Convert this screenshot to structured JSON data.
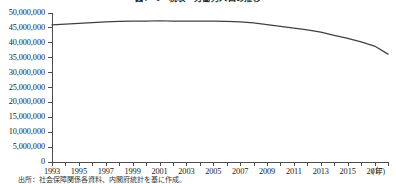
{
  "figure": {
    "title": "図4－1　税収・労働力人口の推移",
    "source_note": "出所：社会保障関係各資料、内閣府統計を基に作成。"
  },
  "axes": {
    "y": {
      "label": "",
      "min": 0,
      "max": 50000000,
      "step": 5000000,
      "tick_labels": [
        "50,000,000",
        "45,000,000",
        "40,000,000",
        "35,000,000",
        "30,000,000",
        "25,000,000",
        "20,000,000",
        "15,000,000",
        "10,000,000",
        "5,000,000",
        "0"
      ]
    },
    "x": {
      "unit_label": "(年)",
      "min": 1993,
      "max": 2018,
      "tick_labels": [
        "1993",
        "1995",
        "1997",
        "1999",
        "2001",
        "2003",
        "2005",
        "2007",
        "2009",
        "2011",
        "2013",
        "2015",
        "2017"
      ]
    }
  },
  "style": {
    "line_color": "#404040",
    "axis_color": "#4d4d4d",
    "text_color": "#1a1a1a",
    "background": "#ffffff"
  },
  "chart_data": {
    "type": "line",
    "title": "図4－1　税収・労働力人口の推移",
    "xlabel": "(年)",
    "ylabel": "",
    "xlim": [
      1993,
      2018
    ],
    "ylim": [
      0,
      50000000
    ],
    "grid": false,
    "legend": "none",
    "x": [
      1993,
      1994,
      1995,
      1996,
      1997,
      1998,
      1999,
      2000,
      2001,
      2002,
      2003,
      2004,
      2005,
      2006,
      2007,
      2008,
      2009,
      2010,
      2011,
      2012,
      2013,
      2014,
      2015,
      2016,
      2017,
      2018
    ],
    "series": [
      {
        "name": "推移",
        "values": [
          46000000,
          46250000,
          46500000,
          46800000,
          47050000,
          47200000,
          47250000,
          47300000,
          47400000,
          47300000,
          47250000,
          47300000,
          47250000,
          47150000,
          47000000,
          46700000,
          46100000,
          45500000,
          44900000,
          44300000,
          43600000,
          42500000,
          41500000,
          40300000,
          38900000,
          36200000
        ]
      }
    ]
  }
}
